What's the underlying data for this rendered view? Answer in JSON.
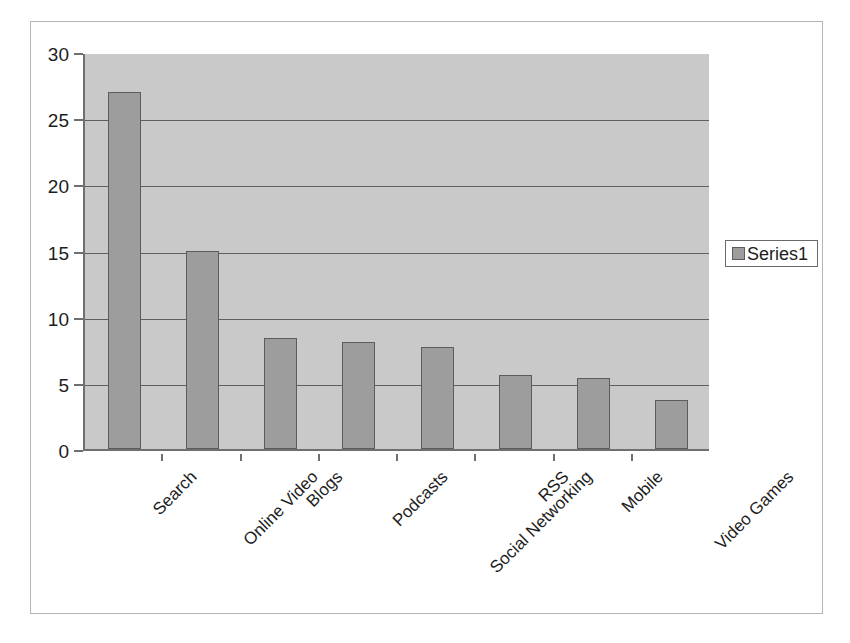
{
  "chart_data": {
    "type": "bar",
    "title": "",
    "xlabel": "",
    "ylabel": "",
    "ylim": [
      0,
      30
    ],
    "ytick_step": 5,
    "yticks": [
      0,
      5,
      10,
      15,
      20,
      25,
      30
    ],
    "ytick_labels": [
      "0",
      "5",
      "10",
      "15",
      "20",
      "25",
      "30"
    ],
    "grid": true,
    "legend_position": "right",
    "categories": [
      "Search",
      "Online Video",
      "Blogs",
      "Podcasts",
      "Social Networking",
      "RSS",
      "Mobile",
      "Video Games"
    ],
    "series": [
      {
        "name": "Series1",
        "values": [
          27.0,
          15.0,
          8.4,
          8.1,
          7.7,
          5.6,
          5.4,
          3.7
        ]
      }
    ]
  },
  "legend": {
    "entries": [
      {
        "label": "Series1",
        "color": "#9d9d9d"
      }
    ]
  },
  "colors": {
    "bar_fill": "#9d9d9d",
    "bar_border": "#5c5c5c",
    "plot_background": "#c9c9c9",
    "gridline": "#5f5f5f",
    "axis": "#6f6f6f",
    "text": "#1d1d1d",
    "frame_border": "#b6b6b6",
    "page_background": "#ffffff"
  }
}
